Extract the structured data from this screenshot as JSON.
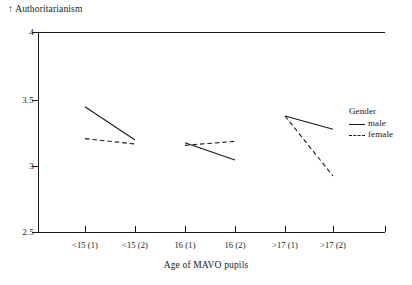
{
  "chart_data": {
    "type": "line",
    "title": "",
    "ylabel": "Authoritarianism",
    "ylabel_prefix": "↑",
    "xlabel": "Age of MAVO pupils",
    "categories": [
      "<15 (1)",
      "<15 (2)",
      "16 (1)",
      "16 (2)",
      ">17 (1)",
      ">17 (2)"
    ],
    "ylim": [
      2.5,
      4
    ],
    "yticks": [
      2.5,
      3,
      3.5,
      4
    ],
    "ytick_labels": [
      "2.5",
      "3",
      "3.5",
      "4"
    ],
    "grid": false,
    "legend_position": "right",
    "note": "Lines are drawn as three separate segments, one per age group pair: (<15(1),<15(2)), (16(1),16(2)), (>17(1),>17(2)).",
    "series": [
      {
        "name": "male",
        "style": "solid",
        "color": "#1a1a1a",
        "values": [
          3.44,
          3.19,
          3.17,
          3.04,
          3.37,
          3.27
        ]
      },
      {
        "name": "female",
        "style": "dashed",
        "color": "#1a1a1a",
        "values": [
          3.2,
          3.16,
          3.15,
          3.18,
          3.37,
          2.92
        ]
      }
    ],
    "segments": [
      {
        "group": "<15",
        "male": [
          3.44,
          3.19
        ],
        "female": [
          3.2,
          3.16
        ]
      },
      {
        "group": "16",
        "male": [
          3.17,
          3.04
        ],
        "female": [
          3.15,
          3.18
        ]
      },
      {
        "group": ">17",
        "male": [
          3.37,
          3.27
        ],
        "female": [
          3.37,
          2.92
        ]
      }
    ]
  },
  "legend": {
    "title": "Gender",
    "entries": [
      {
        "label": "male",
        "style": "solid"
      },
      {
        "label": "female",
        "style": "dashed"
      }
    ]
  },
  "axes": {
    "y_title": "Authoritarianism",
    "y_arrow": "↑",
    "x_title": "Age of MAVO pupils",
    "ytick_labels": [
      "4",
      "3.5",
      "3",
      "2.5"
    ],
    "xtick_labels": [
      "<15 (1)",
      "<15 (2)",
      "16 (1)",
      "16 (2)",
      ">17 (1)",
      ">17 (2)"
    ]
  }
}
